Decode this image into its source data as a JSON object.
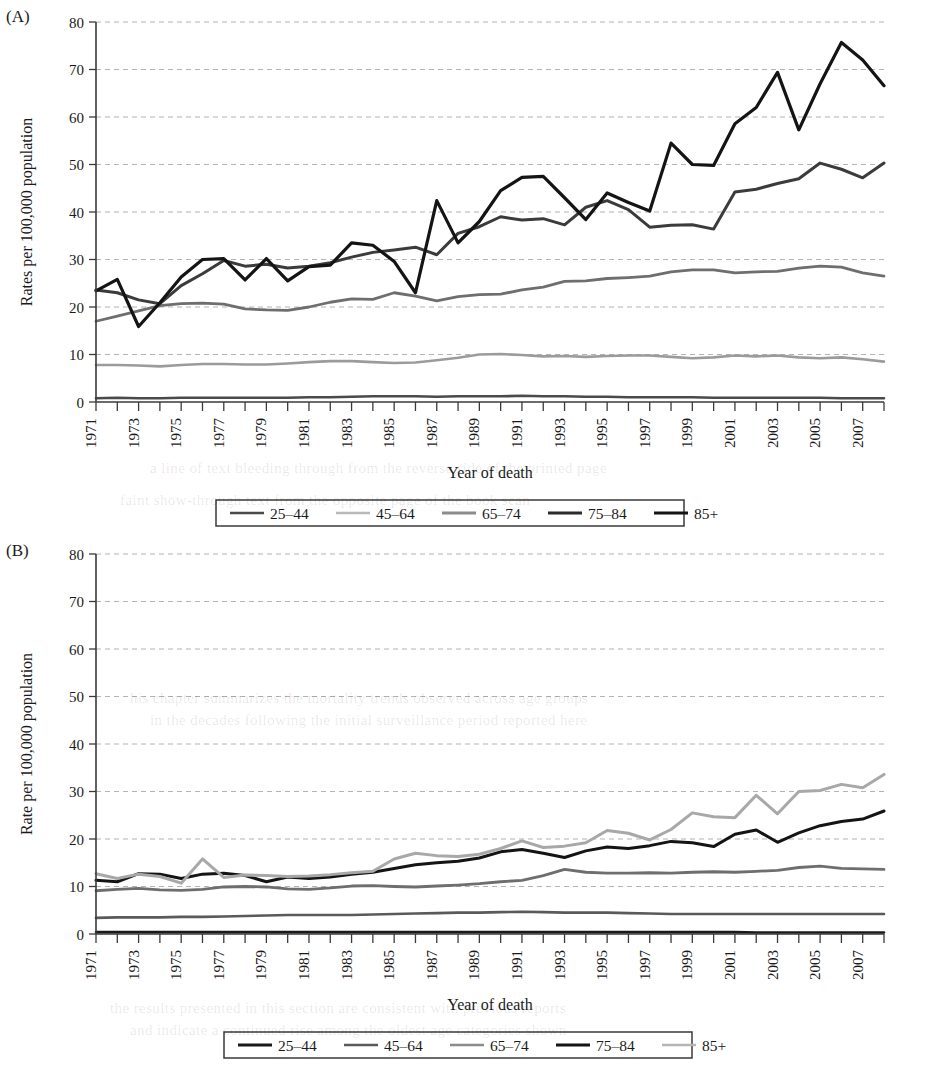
{
  "figure": {
    "panels": [
      {
        "letter": "(A)",
        "ylabel": "Rates per 100,000 population",
        "xlabel": "Year of death"
      },
      {
        "letter": "(B)",
        "ylabel": "Rate per 100,000 population",
        "xlabel": "Year of death"
      }
    ],
    "y_ticks": [
      "0",
      "10",
      "20",
      "30",
      "40",
      "50",
      "60",
      "70",
      "80"
    ],
    "x_ticks": [
      "1971",
      "1973",
      "1975",
      "1977",
      "1979",
      "1981",
      "1983",
      "1985",
      "1987",
      "1989",
      "1991",
      "1993",
      "1995",
      "1997",
      "1999",
      "2001",
      "2003",
      "2005",
      "2007"
    ],
    "colors": {
      "near_black": "#1a1a1a",
      "dark_gray": "#4a4a4a",
      "mid_gray": "#6e6e6e",
      "light_gray": "#9b9b9b",
      "pale_gray": "#b9b9b9",
      "grid": "#9a9a9a",
      "axis": "#3a3a3a"
    }
  },
  "chart_data": [
    {
      "type": "line",
      "panel": "(A)",
      "title": "",
      "xlabel": "Year of death",
      "ylabel": "Rates per 100,000 population",
      "xlim": [
        1971,
        2008
      ],
      "ylim": [
        0,
        80
      ],
      "ytick_step": 10,
      "grid": true,
      "legend_position": "bottom",
      "x": [
        1971,
        1972,
        1973,
        1974,
        1975,
        1976,
        1977,
        1978,
        1979,
        1980,
        1981,
        1982,
        1983,
        1984,
        1985,
        1986,
        1987,
        1988,
        1989,
        1990,
        1991,
        1992,
        1993,
        1994,
        1995,
        1996,
        1997,
        1998,
        1999,
        2000,
        2001,
        2002,
        2003,
        2004,
        2005,
        2006,
        2007,
        2008
      ],
      "series": [
        {
          "name": "25-44",
          "color": "#4a4a4a",
          "width": 2.6,
          "values": [
            0.8,
            0.9,
            0.8,
            0.8,
            0.9,
            0.9,
            0.9,
            0.9,
            0.9,
            0.9,
            1.0,
            1.0,
            1.1,
            1.2,
            1.2,
            1.2,
            1.1,
            1.2,
            1.2,
            1.2,
            1.3,
            1.2,
            1.2,
            1.1,
            1.1,
            1.0,
            1.0,
            1.0,
            1.0,
            0.9,
            0.9,
            0.9,
            0.9,
            0.9,
            0.9,
            0.8,
            0.8,
            0.8
          ]
        },
        {
          "name": "45-64",
          "color": "#9b9b9b",
          "width": 2.6,
          "values": [
            7.8,
            7.8,
            7.7,
            7.5,
            7.8,
            8.0,
            8.0,
            7.9,
            7.9,
            8.1,
            8.4,
            8.6,
            8.6,
            8.4,
            8.2,
            8.3,
            8.8,
            9.3,
            10.0,
            10.1,
            9.9,
            9.6,
            9.7,
            9.5,
            9.7,
            9.8,
            9.8,
            9.5,
            9.2,
            9.4,
            9.8,
            9.6,
            9.8,
            9.4,
            9.2,
            9.4,
            9.0,
            8.5
          ]
        },
        {
          "name": "65-74",
          "color": "#6e6e6e",
          "width": 2.8,
          "values": [
            17.0,
            18.1,
            19.2,
            20.3,
            20.7,
            20.8,
            20.6,
            19.6,
            19.4,
            19.3,
            20.0,
            21.0,
            21.7,
            21.6,
            23.0,
            22.3,
            21.3,
            22.2,
            22.6,
            22.7,
            23.6,
            24.2,
            25.4,
            25.5,
            26.0,
            26.2,
            26.5,
            27.4,
            27.8,
            27.8,
            27.2,
            27.4,
            27.5,
            28.2,
            28.6,
            28.4,
            27.2,
            26.5
          ]
        },
        {
          "name": "75-84",
          "color": "#3b3b3b",
          "width": 3.0,
          "values": [
            23.6,
            23.0,
            21.5,
            20.7,
            24.5,
            27.0,
            29.8,
            28.6,
            29.0,
            28.2,
            28.6,
            29.3,
            30.5,
            31.5,
            32.0,
            32.6,
            31.0,
            35.5,
            36.9,
            39.0,
            38.3,
            38.6,
            37.3,
            41.0,
            42.4,
            40.5,
            36.8,
            37.2,
            37.3,
            36.4,
            44.2,
            44.8,
            46.0,
            47.0,
            50.3,
            49.0,
            47.2,
            50.3
          ]
        },
        {
          "name": "85+",
          "color": "#141414",
          "width": 3.2,
          "values": [
            23.4,
            25.8,
            15.9,
            20.9,
            26.3,
            30.0,
            30.2,
            25.7,
            30.2,
            25.5,
            28.5,
            28.8,
            33.5,
            33.0,
            29.6,
            23.0,
            42.4,
            33.5,
            38.0,
            44.5,
            47.3,
            47.5,
            43.0,
            38.4,
            44.0,
            42.0,
            40.2,
            54.5,
            50.0,
            49.8,
            58.6,
            62.0,
            69.4,
            57.3,
            67.0,
            75.7,
            72.0,
            66.6
          ]
        }
      ]
    },
    {
      "type": "line",
      "panel": "(B)",
      "title": "",
      "xlabel": "Year of death",
      "ylabel": "Rate per 100,000 population",
      "xlim": [
        1971,
        2008
      ],
      "ylim": [
        0,
        80
      ],
      "ytick_step": 10,
      "grid": true,
      "legend_position": "bottom",
      "x": [
        1971,
        1972,
        1973,
        1974,
        1975,
        1976,
        1977,
        1978,
        1979,
        1980,
        1981,
        1982,
        1983,
        1984,
        1985,
        1986,
        1987,
        1988,
        1989,
        1990,
        1991,
        1992,
        1993,
        1994,
        1995,
        1996,
        1997,
        1998,
        1999,
        2000,
        2001,
        2002,
        2003,
        2004,
        2005,
        2006,
        2007,
        2008
      ],
      "series": [
        {
          "name": "25-44",
          "color": "#1a1a1a",
          "width": 2.6,
          "values": [
            0.4,
            0.4,
            0.4,
            0.4,
            0.4,
            0.4,
            0.4,
            0.4,
            0.4,
            0.4,
            0.4,
            0.4,
            0.4,
            0.4,
            0.4,
            0.4,
            0.4,
            0.4,
            0.4,
            0.4,
            0.4,
            0.4,
            0.4,
            0.4,
            0.4,
            0.4,
            0.4,
            0.4,
            0.4,
            0.4,
            0.4,
            0.3,
            0.3,
            0.3,
            0.3,
            0.3,
            0.3,
            0.3
          ]
        },
        {
          "name": "45-64",
          "color": "#5a5a5a",
          "width": 2.6,
          "values": [
            3.4,
            3.5,
            3.5,
            3.5,
            3.6,
            3.6,
            3.7,
            3.8,
            3.9,
            4.0,
            4.0,
            4.0,
            4.0,
            4.1,
            4.2,
            4.3,
            4.4,
            4.5,
            4.5,
            4.6,
            4.7,
            4.6,
            4.5,
            4.5,
            4.5,
            4.4,
            4.3,
            4.2,
            4.2,
            4.2,
            4.2,
            4.2,
            4.2,
            4.2,
            4.2,
            4.2,
            4.2,
            4.2
          ]
        },
        {
          "name": "65-74",
          "color": "#6e6e6e",
          "width": 2.8,
          "values": [
            9.1,
            9.4,
            9.6,
            9.3,
            9.2,
            9.4,
            9.9,
            10.0,
            9.9,
            9.5,
            9.4,
            9.7,
            10.1,
            10.2,
            10.0,
            9.9,
            10.1,
            10.3,
            10.6,
            11.0,
            11.3,
            12.3,
            13.6,
            13.0,
            12.8,
            12.8,
            12.9,
            12.8,
            13.0,
            13.1,
            13.0,
            13.2,
            13.4,
            14.0,
            14.3,
            13.8,
            13.7,
            13.6
          ]
        },
        {
          "name": "75-84",
          "color": "#141414",
          "width": 3.0,
          "values": [
            11.3,
            11.0,
            12.7,
            12.6,
            11.7,
            12.6,
            12.8,
            12.3,
            11.0,
            12.0,
            11.7,
            12.0,
            12.6,
            13.0,
            13.8,
            14.6,
            15.0,
            15.3,
            16.0,
            17.3,
            17.8,
            17.0,
            16.1,
            17.5,
            18.3,
            18.0,
            18.6,
            19.5,
            19.2,
            18.4,
            21.0,
            21.9,
            19.3,
            21.3,
            22.8,
            23.7,
            24.2,
            25.9
          ]
        },
        {
          "name": "85+",
          "color": "#a8a8a8",
          "width": 3.0,
          "values": [
            12.7,
            11.7,
            12.6,
            12.1,
            10.7,
            15.8,
            11.9,
            12.4,
            12.3,
            12.1,
            12.2,
            12.5,
            12.9,
            13.2,
            15.8,
            17.0,
            16.5,
            16.3,
            16.8,
            18.0,
            19.6,
            18.2,
            18.5,
            19.2,
            21.8,
            21.2,
            19.8,
            22.0,
            25.5,
            24.7,
            24.5,
            29.2,
            25.3,
            30.0,
            30.2,
            31.5,
            30.8,
            33.6
          ]
        }
      ]
    }
  ],
  "legends": [
    {
      "panel": "(A)",
      "items": [
        {
          "label": "25-44",
          "color": "#4a4a4a",
          "width": 2.6
        },
        {
          "label": "45-64",
          "color": "#b9b9b9",
          "width": 2.6
        },
        {
          "label": "65-74",
          "color": "#8c8c8c",
          "width": 2.8
        },
        {
          "label": "75-84",
          "color": "#2b2b2b",
          "width": 3.0
        },
        {
          "label": "85+",
          "color": "#141414",
          "width": 3.2
        }
      ]
    },
    {
      "panel": "(B)",
      "items": [
        {
          "label": "25-44",
          "color": "#1a1a1a",
          "width": 2.8
        },
        {
          "label": "45-64",
          "color": "#5a5a5a",
          "width": 2.6
        },
        {
          "label": "65-74",
          "color": "#8c8c8c",
          "width": 2.6
        },
        {
          "label": "75-84",
          "color": "#141414",
          "width": 3.0
        },
        {
          "label": "85+",
          "color": "#b5b5b5",
          "width": 2.6
        }
      ]
    }
  ],
  "background_artifacts": [
    {
      "text": "a line of text bleeding through from the reverse side of the printed page",
      "top": 460,
      "left": 150
    },
    {
      "text": "faint show-through text from the opposite page of the book scan",
      "top": 492,
      "left": 120
    },
    {
      "text": "his chapter summarizes the mortality trends observed across age groups",
      "top": 690,
      "left": 130
    },
    {
      "text": "in the decades following the initial surveillance period reported here",
      "top": 712,
      "left": 150
    },
    {
      "text": "the results presented in this section are consistent with previous reports",
      "top": 1000,
      "left": 110
    },
    {
      "text": "and indicate a continued rise among the oldest age categories shown",
      "top": 1022,
      "left": 130
    }
  ]
}
